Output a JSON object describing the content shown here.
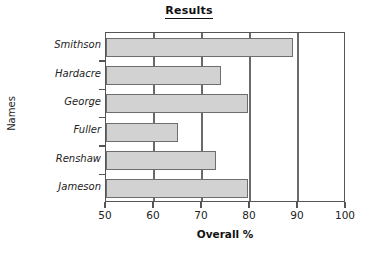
{
  "chart_data": {
    "type": "bar",
    "orientation": "horizontal",
    "title": "Results",
    "xlabel": "Overall %",
    "ylabel": "Names",
    "categories": [
      "Smithson",
      "Hardacre",
      "George",
      "Fuller",
      "Renshaw",
      "Jameson"
    ],
    "values": [
      89,
      74,
      79.5,
      65,
      73,
      79.5
    ],
    "xlim": [
      50,
      100
    ],
    "xticks": [
      50,
      60,
      70,
      80,
      90,
      100
    ],
    "xtick_labels": [
      "50",
      "60",
      "70",
      "80",
      "90",
      "100"
    ],
    "grid": "vertical",
    "legend": "none",
    "bar_fill_color": "#d2d2d2",
    "bar_border_color": "#6e6e6e",
    "axis_color": "#555555"
  }
}
